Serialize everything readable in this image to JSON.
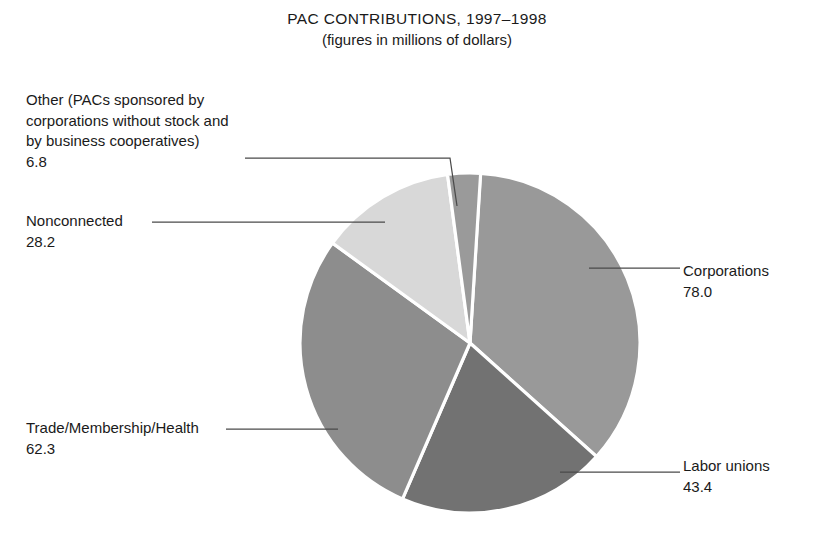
{
  "chart_data": {
    "type": "pie",
    "title": "PAC CONTRIBUTIONS, 1997–1998",
    "subtitle": "(figures in millions of dollars)",
    "unit": "millions of dollars",
    "total": 218.7,
    "legend_position": "callout-labels",
    "grid": false,
    "categories": [
      "Corporations",
      "Labor unions",
      "Trade/Membership/Health",
      "Nonconnected",
      "Other (PACs sponsored by corporations without stock and by business cooperatives)"
    ],
    "values": [
      78.0,
      43.4,
      62.3,
      28.2,
      6.8
    ],
    "slices": [
      {
        "key": "corporations",
        "label": "Corporations",
        "value": "78.0",
        "value_num": 78.0,
        "color": "#999999",
        "start_deg": 3.5,
        "sweep_deg": 128.4
      },
      {
        "key": "labor-unions",
        "label": "Labor unions",
        "value": "43.4",
        "value_num": 43.4,
        "color": "#727272",
        "start_deg": 131.9,
        "sweep_deg": 71.5
      },
      {
        "key": "trade-membership-health",
        "label": "Trade/Membership/Health",
        "value": "62.3",
        "value_num": 62.3,
        "color": "#8d8d8d",
        "start_deg": 203.4,
        "sweep_deg": 102.6
      },
      {
        "key": "nonconnected",
        "label": "Nonconnected",
        "value": "28.2",
        "value_num": 28.2,
        "color": "#d8d8d8",
        "start_deg": 306.0,
        "sweep_deg": 46.4
      },
      {
        "key": "other",
        "label": "Other (PACs sponsored by\ncorporations without stock and\nby business cooperatives)",
        "value": "6.8",
        "value_num": 6.8,
        "color": "#9a9a9a",
        "start_deg": 352.4,
        "sweep_deg": 11.2
      }
    ]
  },
  "labels": {
    "other": {
      "name": "Other (PACs sponsored by\ncorporations without stock and\nby business cooperatives)",
      "value": "6.8"
    },
    "nonconnected": {
      "name": "Nonconnected",
      "value": "28.2"
    },
    "trade": {
      "name": "Trade/Membership/Health",
      "value": "62.3"
    },
    "corporations": {
      "name": "Corporations",
      "value": "78.0"
    },
    "labor": {
      "name": "Labor unions",
      "value": "43.4"
    }
  }
}
